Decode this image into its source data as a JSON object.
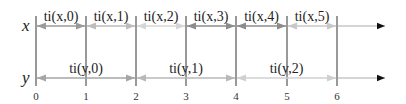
{
  "diagram": {
    "rows": [
      {
        "axis_label": "x",
        "y": 26,
        "intervals": [
          {
            "label": "ti(x,0)",
            "from": 0,
            "to": 1,
            "color": "#9a9a9a"
          },
          {
            "label": "ti(x,1)",
            "from": 1,
            "to": 2,
            "color": "#bdbdbd"
          },
          {
            "label": "ti(x,2)",
            "from": 2,
            "to": 3,
            "color": "#d6d6d6"
          },
          {
            "label": "ti(x,3)",
            "from": 3,
            "to": 4,
            "color": "#8c8c8c"
          },
          {
            "label": "ti(x,4)",
            "from": 4,
            "to": 5,
            "color": "#8c8c8c"
          },
          {
            "label": "ti(x,5)",
            "from": 5,
            "to": 6,
            "color": "#c8c8c8"
          }
        ]
      },
      {
        "axis_label": "y",
        "y": 78,
        "intervals": [
          {
            "label": "ti(y,0)",
            "from": 0,
            "to": 2,
            "color": "#a6a6a6"
          },
          {
            "label": "ti(y,1)",
            "from": 2,
            "to": 4,
            "color": "#b8b8b8"
          },
          {
            "label": "ti(y,2)",
            "from": 4,
            "to": 6,
            "color": "#d0d0d0"
          }
        ]
      }
    ],
    "ticks": [
      "0",
      "1",
      "2",
      "3",
      "4",
      "5",
      "6"
    ],
    "tick_positions": [
      36,
      86,
      136,
      186,
      236,
      287,
      337
    ]
  }
}
